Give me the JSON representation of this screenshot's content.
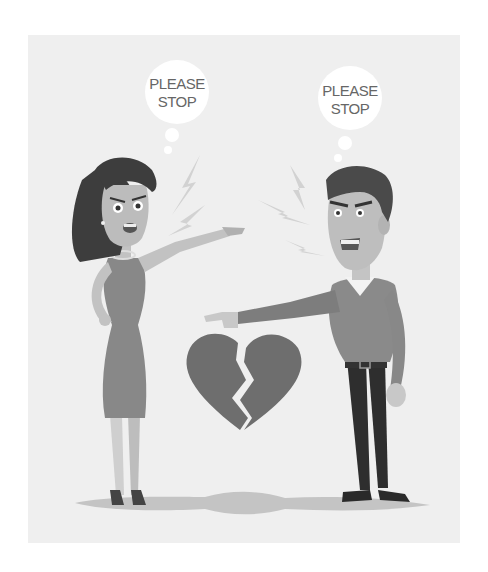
{
  "illustration": {
    "subject": "couple arguing",
    "left_bubble": {
      "line1": "PLEASE",
      "line2": "STOP"
    },
    "right_bubble": {
      "line1": "PLEASE",
      "line2": "STOP"
    },
    "center_icon": "broken-heart-icon"
  },
  "colors": {
    "background": "#efefef",
    "outer": "#ffffff",
    "heart": "#6e6e6e",
    "dress": "#888888",
    "sweater": "#8a8a8a",
    "pants": "#2e2e2e",
    "hair": "#3d3d3d",
    "shadow": "#c4c4c4"
  }
}
